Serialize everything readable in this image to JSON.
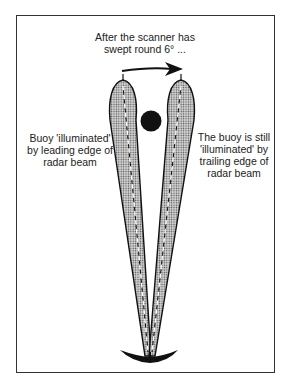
{
  "title": {
    "line1": "After the scanner has",
    "line2": "swept round 6° ..."
  },
  "left_annotation": {
    "line1": "Buoy 'illuminated'",
    "line2": "by leading edge of",
    "line3": "radar beam"
  },
  "right_annotation": {
    "line1": "The buoy  is still",
    "line2": "'illuminated' by",
    "line3": "trailing edge of",
    "line4": "radar beam"
  },
  "elements": {
    "sweep_arrow": "arrow-right-icon",
    "buoy": "buoy-icon",
    "scanner": "radar-scanner-icon",
    "beam_left": "leading-beam",
    "beam_right": "trailing-beam"
  },
  "sweep_angle_deg": 6,
  "colors": {
    "ink": "#222222",
    "frame": "#333333",
    "beam_fill": "#bdbdbd",
    "background": "#ffffff"
  }
}
